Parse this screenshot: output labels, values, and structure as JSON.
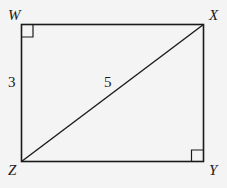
{
  "diagram": {
    "vertices": {
      "W": {
        "label": "W"
      },
      "X": {
        "label": "X"
      },
      "Y": {
        "label": "Y"
      },
      "Z": {
        "label": "Z"
      }
    },
    "sides": {
      "WZ": "3",
      "ZX": "5"
    },
    "right_angles": [
      "W",
      "Y"
    ]
  }
}
